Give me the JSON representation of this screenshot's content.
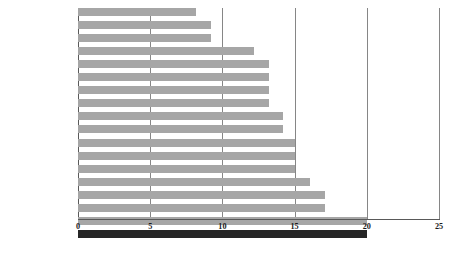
{
  "chart_data": {
    "type": "bar",
    "orientation": "horizontal",
    "title": "",
    "subtitle": "",
    "xlabel": "",
    "ylabel": "",
    "xlim": [
      0,
      25
    ],
    "ylim": null,
    "grid": true,
    "grid_axis": "x",
    "legend": null,
    "legend_position": "none",
    "xticks": [
      "0",
      "5",
      "10",
      "15",
      "20",
      "25"
    ],
    "xtick_values": [
      0,
      5,
      10,
      15,
      20,
      25
    ],
    "categories": [
      "Portugal",
      "Greece",
      "Spain",
      "Denmark",
      "Finland",
      "Italy",
      "Sweden",
      "Switzerland",
      "Netherlands",
      "Norway",
      "Austria",
      "Belgium",
      "Germany",
      "France",
      "Iceland",
      "United Kingdom",
      "Ireland",
      "United States"
    ],
    "values": [
      8.2,
      9.2,
      9.2,
      12.2,
      13.2,
      13.2,
      13.2,
      13.2,
      14.2,
      14.2,
      15.0,
      15.0,
      15.0,
      16.1,
      17.1,
      17.1,
      20.0,
      20.0
    ],
    "highlight_category": "United States",
    "colors": {
      "bar": "#a6a6a6",
      "bar_highlight": "#262626",
      "gridline": "#868686",
      "axis": "#595959",
      "text": "#1a1a1a",
      "background": "#ffffff"
    }
  }
}
